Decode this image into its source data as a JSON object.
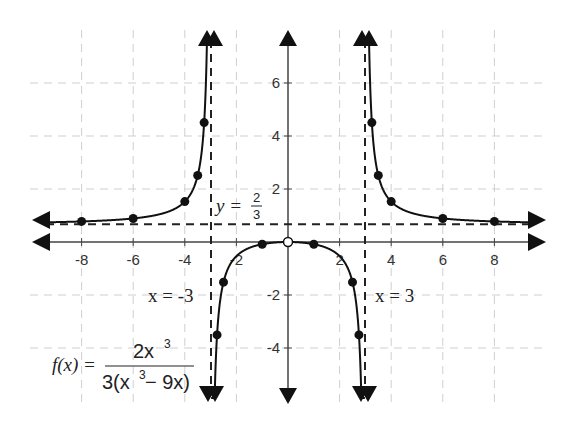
{
  "chart_data": {
    "type": "line",
    "title": "",
    "function_label": "f(x) = 2x^3 / (3(x^3 - 9x))",
    "xlabel": "",
    "ylabel": "",
    "xlim": [
      -9.8,
      9.8
    ],
    "ylim": [
      -6,
      8
    ],
    "grid": true,
    "x_ticks": [
      -8,
      -6,
      -4,
      -2,
      2,
      4,
      6,
      8
    ],
    "y_ticks": [
      -4,
      -2,
      2,
      4,
      6
    ],
    "asymptotes": {
      "vertical": [
        {
          "x": -3,
          "label": "x = -3"
        },
        {
          "x": 3,
          "label": "x = 3"
        }
      ],
      "horizontal": [
        {
          "y": 0.6667,
          "label": "y = 2/3"
        }
      ]
    },
    "series": [
      {
        "name": "left branch",
        "points": [
          [
            -8,
            0.78
          ],
          [
            -6,
            0.89
          ],
          [
            -4,
            1.52
          ],
          [
            -3.5,
            2.51
          ],
          [
            -3.25,
            4.51
          ]
        ]
      },
      {
        "name": "middle branch",
        "points": [
          [
            -2.75,
            -3.51
          ],
          [
            -2.5,
            -1.52
          ],
          [
            -1,
            -0.08
          ],
          [
            1,
            -0.08
          ],
          [
            2.5,
            -1.52
          ],
          [
            2.75,
            -3.51
          ]
        ]
      },
      {
        "name": "right branch",
        "points": [
          [
            3.25,
            4.51
          ],
          [
            3.5,
            2.51
          ],
          [
            4,
            1.52
          ],
          [
            6,
            0.89
          ],
          [
            8,
            0.78
          ]
        ]
      }
    ],
    "open_points": [
      [
        0,
        0
      ]
    ]
  },
  "labels": {
    "ha": "y = ",
    "ha_num": "2",
    "ha_den": "3",
    "va_left": "x = -3",
    "va_right": "x = 3",
    "fx": "f(x) =",
    "num": "2x",
    "num_exp": "3",
    "den_a": "3(x",
    "den_exp": "3",
    "den_b": " − 9x)"
  },
  "ticks": {
    "x": [
      "-8",
      "-6",
      "-4",
      "-2",
      "2",
      "4",
      "6",
      "8"
    ],
    "y": [
      "6",
      "4",
      "2",
      "-2",
      "-4"
    ]
  }
}
